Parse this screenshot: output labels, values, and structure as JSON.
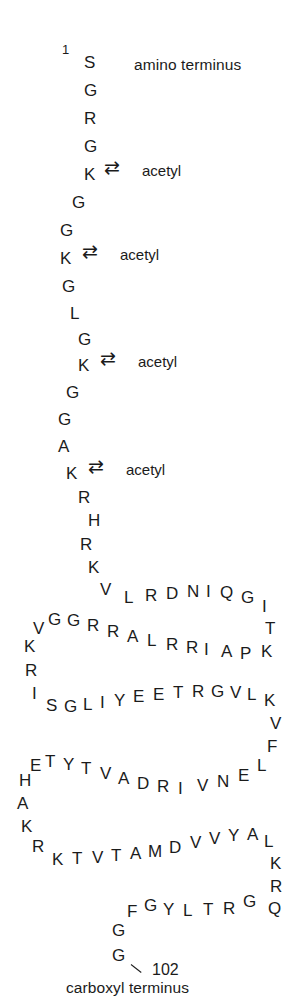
{
  "figure": {
    "title_top": "amino terminus",
    "title_bottom": "carboxyl terminus",
    "start_number": "1",
    "end_number": "102",
    "equilibrium_glyph": "⇄",
    "modification_label": "acetyl",
    "ink_color": "#1b1b1b",
    "background_color": "#ffffff"
  },
  "sequence_tail": {
    "description": "vertical amino-terminal tail residues",
    "residues": [
      {
        "aa": "S",
        "x": 84,
        "y": 54,
        "rot": 0
      },
      {
        "aa": "G",
        "x": 84,
        "y": 82,
        "rot": 0
      },
      {
        "aa": "R",
        "x": 84,
        "y": 110,
        "rot": 0
      },
      {
        "aa": "G",
        "x": 84,
        "y": 138,
        "rot": 0
      },
      {
        "aa": "K",
        "x": 84,
        "y": 166,
        "rot": 0
      },
      {
        "aa": "G",
        "x": 72,
        "y": 194,
        "rot": 0
      },
      {
        "aa": "G",
        "x": 60,
        "y": 222,
        "rot": 0
      },
      {
        "aa": "K",
        "x": 60,
        "y": 250,
        "rot": 0
      },
      {
        "aa": "G",
        "x": 62,
        "y": 278,
        "rot": 0
      },
      {
        "aa": "L",
        "x": 70,
        "y": 305,
        "rot": 0
      },
      {
        "aa": "G",
        "x": 78,
        "y": 331,
        "rot": 0
      },
      {
        "aa": "K",
        "x": 78,
        "y": 357,
        "rot": 0
      },
      {
        "aa": "G",
        "x": 66,
        "y": 384,
        "rot": 0
      },
      {
        "aa": "G",
        "x": 58,
        "y": 411,
        "rot": 0
      },
      {
        "aa": "A",
        "x": 58,
        "y": 438,
        "rot": 0
      },
      {
        "aa": "K",
        "x": 66,
        "y": 465,
        "rot": 0
      },
      {
        "aa": "R",
        "x": 78,
        "y": 489,
        "rot": 0
      },
      {
        "aa": "H",
        "x": 88,
        "y": 512,
        "rot": 0
      },
      {
        "aa": "R",
        "x": 80,
        "y": 536,
        "rot": 0
      },
      {
        "aa": "K",
        "x": 88,
        "y": 559,
        "rot": 0
      }
    ]
  },
  "acetyl_sites": [
    {
      "eq_x": 104,
      "eq_y": 158,
      "lbl_x": 142,
      "lbl_y": 162
    },
    {
      "eq_x": 82,
      "eq_y": 242,
      "lbl_x": 120,
      "lbl_y": 246
    },
    {
      "eq_x": 100,
      "eq_y": 349,
      "lbl_x": 138,
      "lbl_y": 353
    },
    {
      "eq_x": 88,
      "eq_y": 457,
      "lbl_x": 126,
      "lbl_y": 461
    }
  ],
  "sequence_body": {
    "description": "globular-domain residues arranged in serpentine rows",
    "residues": [
      {
        "aa": "V",
        "x": 100,
        "y": 581,
        "rot": 0
      },
      {
        "aa": "L",
        "x": 124,
        "y": 589,
        "rot": 0
      },
      {
        "aa": "R",
        "x": 145,
        "y": 587,
        "rot": 0
      },
      {
        "aa": "D",
        "x": 166,
        "y": 585,
        "rot": 0
      },
      {
        "aa": "N",
        "x": 187,
        "y": 583,
        "rot": 0
      },
      {
        "aa": "I",
        "x": 206,
        "y": 583,
        "rot": 0
      },
      {
        "aa": "Q",
        "x": 220,
        "y": 584,
        "rot": 0
      },
      {
        "aa": "G",
        "x": 241,
        "y": 589,
        "rot": 0
      },
      {
        "aa": "I",
        "x": 262,
        "y": 598,
        "rot": 0
      },
      {
        "aa": "T",
        "x": 265,
        "y": 620,
        "rot": 0
      },
      {
        "aa": "K",
        "x": 261,
        "y": 643,
        "rot": 0
      },
      {
        "aa": "P",
        "x": 240,
        "y": 645,
        "rot": 0
      },
      {
        "aa": "A",
        "x": 221,
        "y": 643,
        "rot": 0
      },
      {
        "aa": "I",
        "x": 204,
        "y": 641,
        "rot": 0
      },
      {
        "aa": "R",
        "x": 186,
        "y": 639,
        "rot": 0
      },
      {
        "aa": "R",
        "x": 166,
        "y": 636,
        "rot": 0
      },
      {
        "aa": "L",
        "x": 147,
        "y": 632,
        "rot": 0
      },
      {
        "aa": "A",
        "x": 127,
        "y": 628,
        "rot": 0
      },
      {
        "aa": "R",
        "x": 107,
        "y": 623,
        "rot": 0
      },
      {
        "aa": "R",
        "x": 87,
        "y": 617,
        "rot": 0
      },
      {
        "aa": "G",
        "x": 67,
        "y": 612,
        "rot": 0
      },
      {
        "aa": "G",
        "x": 48,
        "y": 611,
        "rot": 0
      },
      {
        "aa": "V",
        "x": 33,
        "y": 620,
        "rot": 0
      },
      {
        "aa": "K",
        "x": 24,
        "y": 638,
        "rot": 0
      },
      {
        "aa": "R",
        "x": 25,
        "y": 662,
        "rot": 0
      },
      {
        "aa": "I",
        "x": 32,
        "y": 685,
        "rot": 0
      },
      {
        "aa": "S",
        "x": 46,
        "y": 697,
        "rot": 0
      },
      {
        "aa": "G",
        "x": 64,
        "y": 698,
        "rot": 0
      },
      {
        "aa": "L",
        "x": 83,
        "y": 696,
        "rot": 0
      },
      {
        "aa": "I",
        "x": 100,
        "y": 694,
        "rot": 0
      },
      {
        "aa": "Y",
        "x": 114,
        "y": 692,
        "rot": 0
      },
      {
        "aa": "E",
        "x": 133,
        "y": 688,
        "rot": 0
      },
      {
        "aa": "E",
        "x": 153,
        "y": 686,
        "rot": 0
      },
      {
        "aa": "T",
        "x": 173,
        "y": 684,
        "rot": 0
      },
      {
        "aa": "R",
        "x": 192,
        "y": 683,
        "rot": 0
      },
      {
        "aa": "G",
        "x": 211,
        "y": 683,
        "rot": 0
      },
      {
        "aa": "V",
        "x": 230,
        "y": 684,
        "rot": 0
      },
      {
        "aa": "L",
        "x": 247,
        "y": 686,
        "rot": 0
      },
      {
        "aa": "K",
        "x": 264,
        "y": 692,
        "rot": 0
      },
      {
        "aa": "V",
        "x": 270,
        "y": 715,
        "rot": 0
      },
      {
        "aa": "F",
        "x": 267,
        "y": 738,
        "rot": 0
      },
      {
        "aa": "L",
        "x": 257,
        "y": 757,
        "rot": 0
      },
      {
        "aa": "E",
        "x": 238,
        "y": 767,
        "rot": 0
      },
      {
        "aa": "N",
        "x": 217,
        "y": 773,
        "rot": 0
      },
      {
        "aa": "V",
        "x": 197,
        "y": 777,
        "rot": 0
      },
      {
        "aa": "I",
        "x": 178,
        "y": 780,
        "rot": 0
      },
      {
        "aa": "R",
        "x": 157,
        "y": 778,
        "rot": 0
      },
      {
        "aa": "D",
        "x": 137,
        "y": 775,
        "rot": 0
      },
      {
        "aa": "A",
        "x": 118,
        "y": 770,
        "rot": 0
      },
      {
        "aa": "V",
        "x": 100,
        "y": 765,
        "rot": 0
      },
      {
        "aa": "T",
        "x": 81,
        "y": 760,
        "rot": 0
      },
      {
        "aa": "Y",
        "x": 63,
        "y": 756,
        "rot": 0
      },
      {
        "aa": "T",
        "x": 45,
        "y": 753,
        "rot": 0
      },
      {
        "aa": "E",
        "x": 30,
        "y": 757,
        "rot": 0
      },
      {
        "aa": "H",
        "x": 19,
        "y": 772,
        "rot": 0
      },
      {
        "aa": "A",
        "x": 17,
        "y": 795,
        "rot": 0
      },
      {
        "aa": "K",
        "x": 21,
        "y": 818,
        "rot": 0
      },
      {
        "aa": "R",
        "x": 32,
        "y": 838,
        "rot": 0
      },
      {
        "aa": "K",
        "x": 52,
        "y": 851,
        "rot": 0
      },
      {
        "aa": "T",
        "x": 72,
        "y": 850,
        "rot": 0
      },
      {
        "aa": "V",
        "x": 92,
        "y": 849,
        "rot": 0
      },
      {
        "aa": "T",
        "x": 111,
        "y": 847,
        "rot": 0
      },
      {
        "aa": "A",
        "x": 130,
        "y": 845,
        "rot": 0
      },
      {
        "aa": "M",
        "x": 148,
        "y": 843,
        "rot": 0
      },
      {
        "aa": "D",
        "x": 169,
        "y": 839,
        "rot": 0
      },
      {
        "aa": "V",
        "x": 190,
        "y": 834,
        "rot": 0
      },
      {
        "aa": "V",
        "x": 209,
        "y": 830,
        "rot": 0
      },
      {
        "aa": "Y",
        "x": 228,
        "y": 827,
        "rot": 0
      },
      {
        "aa": "A",
        "x": 247,
        "y": 826,
        "rot": 0
      },
      {
        "aa": "L",
        "x": 264,
        "y": 833,
        "rot": 0
      },
      {
        "aa": "K",
        "x": 270,
        "y": 855,
        "rot": 0
      },
      {
        "aa": "R",
        "x": 270,
        "y": 878,
        "rot": 0
      },
      {
        "aa": "Q",
        "x": 268,
        "y": 900,
        "rot": 0
      },
      {
        "aa": "G",
        "x": 243,
        "y": 893,
        "rot": 0
      },
      {
        "aa": "R",
        "x": 223,
        "y": 900,
        "rot": 0
      },
      {
        "aa": "T",
        "x": 203,
        "y": 901,
        "rot": 0
      },
      {
        "aa": "L",
        "x": 183,
        "y": 902,
        "rot": 0
      },
      {
        "aa": "Y",
        "x": 163,
        "y": 901,
        "rot": 0
      },
      {
        "aa": "G",
        "x": 144,
        "y": 897,
        "rot": 0
      },
      {
        "aa": "F",
        "x": 127,
        "y": 903,
        "rot": 0
      },
      {
        "aa": "G",
        "x": 112,
        "y": 922,
        "rot": 0
      },
      {
        "aa": "G",
        "x": 112,
        "y": 947,
        "rot": 0
      }
    ]
  },
  "markers": {
    "start": {
      "x": 62,
      "y": 42
    },
    "end": {
      "x": 152,
      "y": 961
    },
    "tick": {
      "x": 131,
      "y": 964
    }
  },
  "labels": {
    "amino": {
      "x": 134,
      "y": 56
    },
    "carboxyl": {
      "x": 66,
      "y": 959
    }
  }
}
